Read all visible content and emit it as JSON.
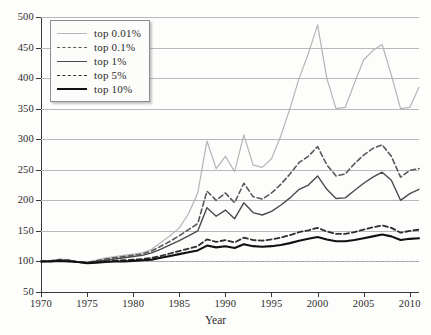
{
  "chart_data": {
    "type": "line",
    "title": "",
    "xlabel": "Year",
    "ylabel": "",
    "xlim": [
      1970,
      2011
    ],
    "ylim": [
      50,
      500
    ],
    "grid": true,
    "legend_position": "top-left",
    "reference_line": 100,
    "x_ticks": [
      1970,
      1975,
      1980,
      1985,
      1990,
      1995,
      2000,
      2005,
      2010
    ],
    "y_ticks": [
      50,
      100,
      150,
      200,
      250,
      300,
      350,
      400,
      450,
      500
    ],
    "x": [
      1970,
      1971,
      1972,
      1973,
      1974,
      1975,
      1976,
      1977,
      1978,
      1979,
      1980,
      1981,
      1982,
      1983,
      1984,
      1985,
      1986,
      1987,
      1988,
      1989,
      1990,
      1991,
      1992,
      1993,
      1994,
      1995,
      1996,
      1997,
      1998,
      1999,
      2000,
      2001,
      2002,
      2003,
      2004,
      2005,
      2006,
      2007,
      2008,
      2009,
      2010,
      2011
    ],
    "series": [
      {
        "name": "top 0.01%",
        "color": "#b5b5b5",
        "style": "solid",
        "width": 1.2,
        "values": [
          100,
          101,
          104,
          103,
          99,
          98,
          102,
          106,
          108,
          110,
          112,
          114,
          120,
          131,
          142,
          155,
          178,
          212,
          297,
          252,
          272,
          247,
          307,
          258,
          254,
          268,
          305,
          350,
          400,
          440,
          487,
          400,
          350,
          352,
          392,
          430,
          445,
          455,
          405,
          350,
          352,
          385
        ]
      },
      {
        "name": "top 0.1%",
        "color": "#585858",
        "style": "dashed",
        "width": 1.6,
        "values": [
          100,
          101,
          103,
          102,
          99,
          98,
          101,
          104,
          106,
          108,
          110,
          112,
          117,
          125,
          133,
          142,
          152,
          162,
          215,
          200,
          212,
          196,
          228,
          206,
          202,
          212,
          226,
          243,
          262,
          272,
          288,
          258,
          240,
          243,
          260,
          274,
          285,
          291,
          272,
          238,
          249,
          252
        ]
      },
      {
        "name": "top 1%",
        "color": "#4a4a4a",
        "style": "solid",
        "width": 1.4,
        "values": [
          100,
          101,
          102,
          102,
          99,
          98,
          100,
          102,
          104,
          106,
          108,
          110,
          114,
          120,
          127,
          134,
          142,
          150,
          188,
          174,
          184,
          170,
          196,
          180,
          176,
          182,
          192,
          204,
          218,
          225,
          240,
          218,
          203,
          204,
          216,
          228,
          238,
          246,
          233,
          200,
          211,
          218
        ]
      },
      {
        "name": "top 5%",
        "color": "#2f2f2f",
        "style": "dashed",
        "width": 1.8,
        "values": [
          100,
          100,
          101,
          101,
          99,
          98,
          99,
          100,
          101,
          102,
          103,
          104,
          106,
          109,
          113,
          117,
          121,
          125,
          136,
          132,
          135,
          131,
          139,
          135,
          134,
          136,
          139,
          143,
          148,
          151,
          155,
          149,
          145,
          145,
          148,
          152,
          156,
          159,
          155,
          147,
          150,
          152
        ]
      },
      {
        "name": "top 10%",
        "color": "#111111",
        "style": "solid",
        "width": 2.1,
        "values": [
          100,
          100,
          101,
          100,
          99,
          97,
          98,
          99,
          100,
          100,
          101,
          102,
          103,
          106,
          109,
          112,
          115,
          118,
          126,
          123,
          125,
          122,
          128,
          125,
          124,
          125,
          127,
          130,
          134,
          137,
          140,
          136,
          133,
          133,
          135,
          138,
          141,
          144,
          141,
          135,
          137,
          138
        ]
      }
    ]
  }
}
